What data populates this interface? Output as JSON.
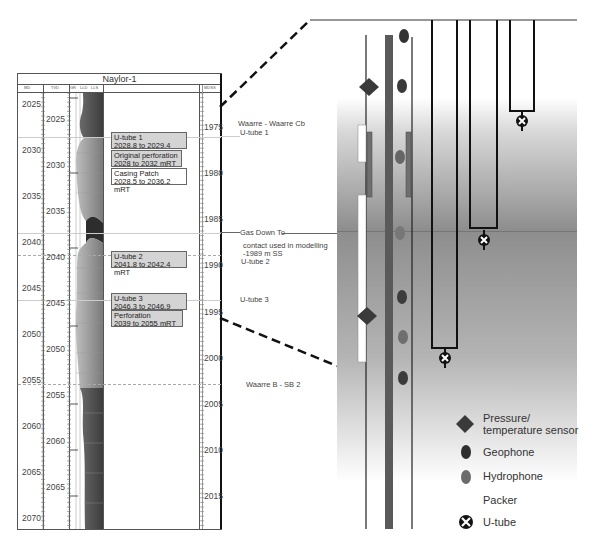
{
  "log": {
    "title": "Naylor-1",
    "headers": [
      "MD",
      "TVD",
      "GR",
      "LLD",
      "LLS",
      "MDSS"
    ],
    "md_ticks": [
      2025,
      2030,
      2035,
      2040,
      2045,
      2050,
      2055,
      2060,
      2065,
      2070
    ],
    "tvd_ticks": [
      2025,
      2030,
      2035,
      2040,
      2045,
      2050,
      2055,
      2060,
      2065
    ],
    "ss_ticks": [
      1975,
      1980,
      1985,
      1990,
      1995,
      2000,
      2005,
      2010,
      2015
    ],
    "annotations": [
      {
        "line1": "U-tube 1",
        "line2": "2028.8 to 2029.4 mRT",
        "style": "grey"
      },
      {
        "line1": "Original perforation",
        "line2": "2028 to 2032 mRT",
        "style": "grey"
      },
      {
        "line1": "Casing Patch",
        "line2": "2028.5 to 2036.2 mRT",
        "style": "white"
      },
      {
        "line1": "U-tube 2",
        "line2": "2041.8 to 2042.4 mRT",
        "style": "grey"
      },
      {
        "line1": "U-tube 3",
        "line2": "2046.3 to 2046.9 mRT",
        "style": "grey"
      },
      {
        "line1": "Perforation",
        "line2": "2039 to 2055 mRT",
        "style": "grey"
      }
    ],
    "right_labels": [
      {
        "text": "Waarre - Waarre Cb"
      },
      {
        "text": "U-tube 1"
      },
      {
        "text": "Gas Down To"
      },
      {
        "text": "contact used in modelling"
      },
      {
        "text": "-1989 m SS"
      },
      {
        "text": "U-tube 2"
      },
      {
        "text": "U-tube 3"
      },
      {
        "text": "Waarre B - SB 2"
      }
    ]
  },
  "legend": {
    "items": [
      {
        "icon": "diamond-icon",
        "label": "Pressure/",
        "label2": "temperature sensor",
        "color": "#3a3a3a"
      },
      {
        "icon": "ellipse-icon",
        "label": "Geophone",
        "color": "#2e2e2e"
      },
      {
        "icon": "ellipse-icon",
        "label": "Hydrophone",
        "color": "#6b6b6b"
      },
      {
        "icon": "packer-icon",
        "label": "Packer",
        "color": "#ffffff"
      },
      {
        "icon": "utube-icon",
        "label": "U-tube",
        "color": "#111111"
      }
    ]
  },
  "colors": {
    "gas_zone": "#9a9a9a",
    "water_zone": "#8a8a8a",
    "tubing": "#5a5a5a"
  }
}
